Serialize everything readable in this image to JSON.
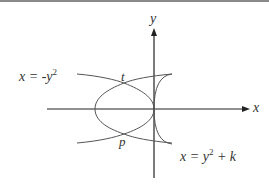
{
  "diagram": {
    "axes": {
      "x_label": "x",
      "y_label": "y"
    },
    "curves": [
      {
        "name": "left-parabola",
        "equation_lhs": "x = -y",
        "exponent": "2",
        "equation_rhs": ""
      },
      {
        "name": "right-parabola",
        "equation_lhs": "x = y",
        "exponent": "2",
        "equation_rhs": " + k"
      }
    ],
    "points": [
      {
        "label": "t"
      },
      {
        "label": "p"
      }
    ],
    "colors": {
      "axis": "#222222",
      "curve": "#555555",
      "text": "#333333",
      "rule": "#8a8a8a"
    }
  }
}
